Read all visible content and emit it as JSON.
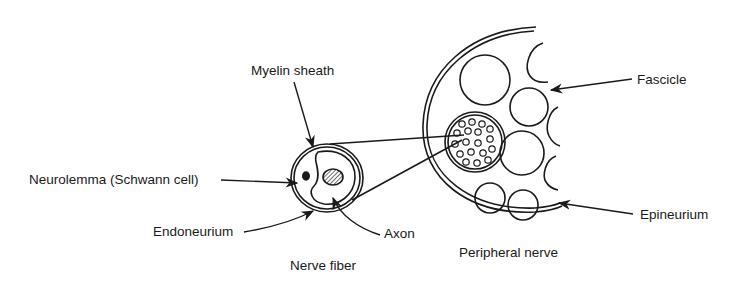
{
  "diagram": {
    "type": "anatomical cross-section",
    "colors": {
      "ink": "#1a1a1a",
      "background": "#ffffff"
    },
    "labels": {
      "myelin_sheath": "Myelin sheath",
      "neurolemma": "Neurolemma (Schwann cell)",
      "endoneurium": "Endoneurium",
      "axon": "Axon",
      "nerve_fiber": "Nerve fiber",
      "peripheral_nerve": "Peripheral nerve",
      "fascicle": "Fascicle",
      "epineurium": "Epineurium"
    },
    "captions": [
      "Nerve fiber",
      "Peripheral nerve"
    ]
  }
}
